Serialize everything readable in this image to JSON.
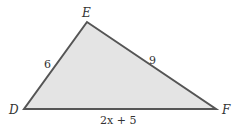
{
  "diagram": {
    "type": "triangle",
    "fill_color": "#e4e4e4",
    "stroke_color": "#555555",
    "vertices": [
      {
        "name": "E",
        "x": 87,
        "y": 22
      },
      {
        "name": "D",
        "x": 24,
        "y": 109
      },
      {
        "name": "F",
        "x": 216,
        "y": 109
      }
    ],
    "sides": [
      {
        "between": "DE",
        "label": "6"
      },
      {
        "between": "EF",
        "label": "9"
      },
      {
        "between": "DF",
        "label": "2x + 5"
      }
    ]
  }
}
